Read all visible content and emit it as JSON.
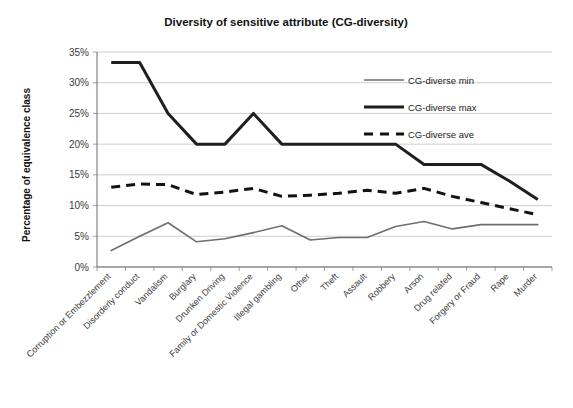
{
  "chart_data": {
    "type": "line",
    "title": "Diversity of sensitive attribute (CG-diversity)",
    "xlabel": "",
    "ylabel": "Percentage of equivalence class",
    "ylim": [
      0,
      35
    ],
    "ytick_labels": [
      "0%",
      "5%",
      "10%",
      "15%",
      "20%",
      "25%",
      "30%",
      "35%"
    ],
    "ytick_values": [
      0,
      5,
      10,
      15,
      20,
      25,
      30,
      35
    ],
    "grid": true,
    "legend_position": "upper-right",
    "categories": [
      "Corruption or Embezzlement",
      "Disorderly conduct",
      "Vandalism",
      "Burglary",
      "Drunken Driving",
      "Family or Domestic Violence",
      "Illegal gambling",
      "Other",
      "Theft",
      "Assault",
      "Robbery",
      "Arson",
      "Drug related",
      "Forgery or Fraud",
      "Rape",
      "Murder"
    ],
    "series": [
      {
        "name": "CG-diverse min",
        "style": "thin-solid",
        "color": "#6e6e6e",
        "values": [
          2.7,
          5.0,
          7.2,
          4.1,
          4.6,
          5.6,
          6.7,
          4.4,
          4.8,
          4.8,
          6.6,
          7.4,
          6.2,
          6.9,
          6.9,
          6.9
        ]
      },
      {
        "name": "CG-diverse max",
        "style": "thick-solid",
        "color": "#1f1f1f",
        "values": [
          33.3,
          33.3,
          25.0,
          20.0,
          20.0,
          25.0,
          20.0,
          20.0,
          20.0,
          20.0,
          20.0,
          16.7,
          16.7,
          16.7,
          14.0,
          11.0
        ]
      },
      {
        "name": "CG-diverse ave",
        "style": "thick-dashed",
        "color": "#121212",
        "values": [
          13.0,
          13.5,
          13.4,
          11.8,
          12.2,
          12.8,
          11.5,
          11.7,
          12.0,
          12.5,
          12.0,
          12.8,
          11.5,
          10.5,
          9.5,
          8.5
        ]
      }
    ]
  }
}
